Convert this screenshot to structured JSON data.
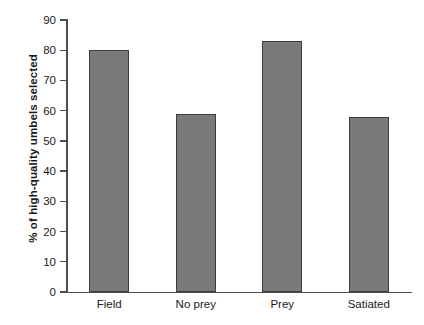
{
  "chart_data": {
    "type": "bar",
    "title": "",
    "subtitle": "",
    "xlabel": "",
    "ylabel": "% of high-quality umbels selected",
    "categories": [
      "Field",
      "No prey",
      "Prey",
      "Satiated"
    ],
    "values": [
      80,
      59,
      83,
      58
    ],
    "series": [
      {
        "name": "% of high-quality umbels selected",
        "values": [
          80,
          59,
          83,
          58
        ]
      }
    ],
    "ylim": [
      0,
      90
    ],
    "xlim": [
      0,
      4
    ],
    "ytick_values": [
      0,
      10,
      20,
      30,
      40,
      50,
      60,
      70,
      80,
      90
    ],
    "ytick_labels": [
      "0",
      "10",
      "20",
      "30",
      "40",
      "50",
      "60",
      "70",
      "80",
      "90"
    ],
    "grid": false,
    "legend": null,
    "legend_position": "none",
    "annotations": [],
    "colors": {
      "bar_fill": "#7a7a7a",
      "bar_edge": "#3d3d3d",
      "axis": "#4d4d4d",
      "text": "#1a1a1a",
      "background": "#ffffff"
    }
  }
}
